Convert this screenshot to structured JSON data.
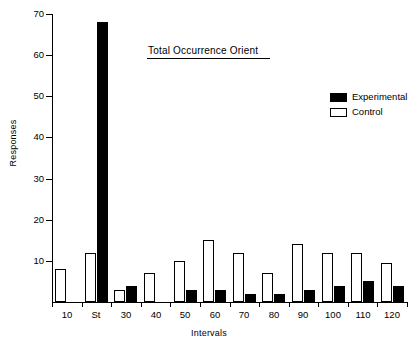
{
  "chart_data": {
    "type": "bar",
    "title": "Total Occurrence Orient",
    "xlabel": "Intervals",
    "ylabel": "Responses",
    "categories": [
      "10",
      "St",
      "30",
      "40",
      "50",
      "60",
      "70",
      "80",
      "90",
      "100",
      "110",
      "120"
    ],
    "series": [
      {
        "name": "Experimental",
        "color": "#000000",
        "style": "filled",
        "values": [
          0,
          68,
          4,
          0,
          3,
          3,
          2,
          2,
          3,
          4,
          5,
          4
        ]
      },
      {
        "name": "Control",
        "color": "#ffffff",
        "style": "hollow",
        "values": [
          8,
          12,
          3,
          7,
          10,
          15,
          12,
          7,
          14,
          12,
          12,
          9.5
        ]
      }
    ],
    "ylim": [
      0,
      70
    ],
    "yticks": [
      0,
      10,
      20,
      30,
      40,
      50,
      60,
      70
    ],
    "ytick_labels": [
      "",
      "10",
      "20",
      "30",
      "40",
      "50",
      "60",
      "70"
    ],
    "grid": false,
    "legend_position": "upper-right"
  },
  "axes": {
    "y_label": "Responses",
    "x_label": "Intervals",
    "y_tick_labels": [
      "70",
      "60",
      "50",
      "40",
      "30",
      "20",
      "10"
    ],
    "x_tick_labels": [
      "10",
      "St",
      "30",
      "40",
      "50",
      "60",
      "70",
      "80",
      "90",
      "100",
      "110",
      "120"
    ]
  },
  "legend": {
    "items": [
      {
        "label": "Experimental",
        "swatch": "filled-square-icon"
      },
      {
        "label": "Control",
        "swatch": "hollow-square-icon"
      }
    ]
  },
  "colors": {
    "experimental": "#000000",
    "control": "#ffffff",
    "axis": "#000000",
    "background": "#ffffff"
  }
}
